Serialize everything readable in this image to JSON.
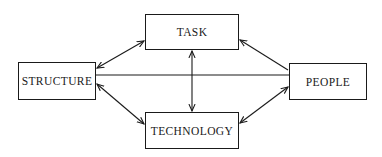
{
  "diagram": {
    "type": "relationship-diagram",
    "nodes": [
      {
        "id": "structure",
        "label": "STRUCTURE"
      },
      {
        "id": "task",
        "label": "TASK"
      },
      {
        "id": "technology",
        "label": "TECHNOLOGY"
      },
      {
        "id": "people",
        "label": "PEOPLE"
      }
    ],
    "edges": [
      {
        "from": "structure",
        "to": "task",
        "arrows": "both"
      },
      {
        "from": "structure",
        "to": "technology",
        "arrows": "both"
      },
      {
        "from": "structure",
        "to": "people",
        "arrows": "none"
      },
      {
        "from": "task",
        "to": "technology",
        "arrows": "both"
      },
      {
        "from": "people",
        "to": "task",
        "arrows": "end"
      },
      {
        "from": "people",
        "to": "technology",
        "arrows": "both"
      }
    ],
    "colors": {
      "stroke": "#1a1a1a",
      "background": "#ffffff"
    }
  }
}
